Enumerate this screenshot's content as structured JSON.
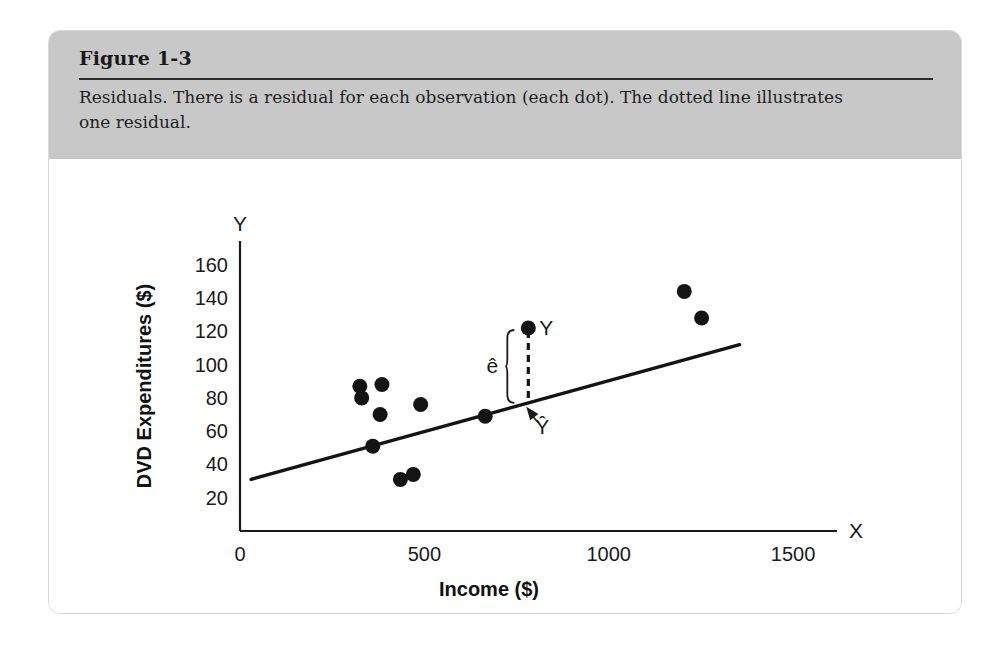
{
  "figure": {
    "title": "Figure 1-3",
    "caption": "Residuals. There is a residual for each observation (each dot). The dotted line illustrates one residual."
  },
  "colors": {
    "header_bg": "#c8c8c8",
    "card_border": "#d8d8d8",
    "ink": "#1a1a1a",
    "point": "#141414",
    "page_bg": "#ffffff"
  },
  "chart_data": {
    "type": "scatter",
    "title": "",
    "xlabel": "Income ($)",
    "ylabel": "DVD Expenditures ($)",
    "x_axis_name": "X",
    "y_axis_name": "Y",
    "xlim": [
      0,
      1560
    ],
    "ylim": [
      0,
      172
    ],
    "grid": false,
    "legend": "none",
    "xticks": [
      0,
      500,
      1000,
      1500
    ],
    "xticklabels": [
      "0",
      "500",
      "1000",
      "1500"
    ],
    "yticks": [
      20,
      40,
      60,
      80,
      100,
      120,
      140,
      160
    ],
    "yticklabels": [
      "20",
      "40",
      "60",
      "80",
      "100",
      "120",
      "140",
      "160"
    ],
    "points": [
      {
        "x": 325,
        "y": 87
      },
      {
        "x": 330,
        "y": 80
      },
      {
        "x": 385,
        "y": 88
      },
      {
        "x": 380,
        "y": 70
      },
      {
        "x": 360,
        "y": 51
      },
      {
        "x": 490,
        "y": 76
      },
      {
        "x": 435,
        "y": 31
      },
      {
        "x": 470,
        "y": 34
      },
      {
        "x": 665,
        "y": 69
      },
      {
        "x": 782,
        "y": 122
      },
      {
        "x": 1205,
        "y": 144
      },
      {
        "x": 1252,
        "y": 128
      }
    ],
    "regression_line": {
      "x_start": 30,
      "y_start": 31,
      "x_end": 1355,
      "y_end": 112,
      "intercept": 29.2,
      "slope": 0.0611
    },
    "annotations": [
      {
        "name": "observed-point-label",
        "text": "Y",
        "x": 800,
        "y": 124
      },
      {
        "name": "residual-brace-label",
        "text": "ê",
        "x": 705,
        "y": 95
      },
      {
        "name": "fitted-value-label",
        "text": "Ŷ",
        "x": 820,
        "y": 58
      },
      {
        "name": "residual-dashed-segment",
        "x": 782,
        "y_top": 122,
        "y_bottom": 77
      }
    ]
  }
}
